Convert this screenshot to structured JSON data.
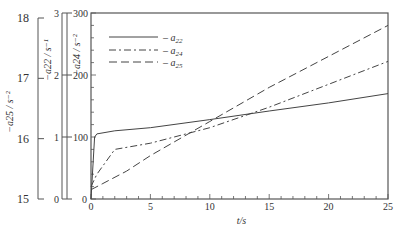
{
  "chart_data": {
    "type": "line",
    "title": "",
    "xlabel": "t/s",
    "x_ticks": [
      0,
      5,
      10,
      15,
      20,
      25
    ],
    "xlim": [
      0,
      25
    ],
    "y_axes": [
      {
        "label": "−a25 / s⁻²",
        "ticks": [
          15,
          16,
          17,
          18
        ],
        "ylim": [
          15,
          18
        ]
      },
      {
        "label": "−a22 / s⁻¹",
        "ticks": [
          0,
          1,
          2,
          3
        ],
        "ylim": [
          0,
          3
        ]
      },
      {
        "label": "−a24 / s⁻²",
        "ticks": [
          0,
          100,
          200,
          300
        ],
        "ylim": [
          0,
          300
        ]
      }
    ],
    "legend": [
      "a22",
      "a24",
      "a25"
    ],
    "legend_position": "upper left",
    "grid": false,
    "series": [
      {
        "name": "a22",
        "style": "solid",
        "axis": "−a22 / s⁻¹",
        "x": [
          0,
          0.3,
          0.5,
          2,
          5,
          10,
          15,
          20,
          25
        ],
        "values": [
          0,
          1.0,
          1.05,
          1.1,
          1.15,
          1.28,
          1.42,
          1.55,
          1.7
        ]
      },
      {
        "name": "a24",
        "style": "dash-dot",
        "axis": "−a24 / s⁻²",
        "x": [
          0,
          0.5,
          2,
          5,
          10,
          15,
          20,
          25
        ],
        "values": [
          20,
          40,
          80,
          90,
          115,
          148,
          185,
          222
        ]
      },
      {
        "name": "a25",
        "style": "dashed",
        "axis": "−a25 / s⁻²",
        "x": [
          0,
          1,
          3,
          5,
          10,
          15,
          20,
          25
        ],
        "values": [
          15.15,
          15.25,
          15.45,
          15.7,
          16.25,
          16.8,
          17.3,
          17.8
        ]
      }
    ]
  },
  "labels": {
    "x_axis": "t/s",
    "a25_axis": "−a25 / s⁻²",
    "a22_axis": "−a22 / s⁻¹",
    "a24_axis": "−a24 / s⁻²"
  }
}
